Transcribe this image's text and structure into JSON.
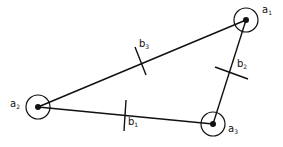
{
  "diagram": {
    "type": "triangle-graph",
    "colors": {
      "stroke": "#111111",
      "background": "#ffffff"
    },
    "nodes": [
      {
        "id": "a1",
        "base": "a",
        "sub": "1",
        "cx": 246,
        "cy": 20,
        "r": 12,
        "label_x": 262,
        "label_y": 5
      },
      {
        "id": "a2",
        "base": "a",
        "sub": "2",
        "cx": 38,
        "cy": 107,
        "r": 12,
        "label_x": 10,
        "label_y": 99
      },
      {
        "id": "a3",
        "base": "a",
        "sub": "3",
        "cx": 213,
        "cy": 124,
        "r": 12,
        "label_x": 228,
        "label_y": 124
      }
    ],
    "edges": [
      {
        "id": "b1",
        "from": "a2",
        "to": "a3",
        "base": "b",
        "sub": "1",
        "tick": [
          126,
          100,
          124,
          131
        ],
        "label_x": 128,
        "label_y": 117
      },
      {
        "id": "b2",
        "from": "a3",
        "to": "a1",
        "base": "b",
        "sub": "2",
        "tick": [
          215,
          67,
          248,
          79
        ],
        "label_x": 237,
        "label_y": 59
      },
      {
        "id": "b3",
        "from": "a1",
        "to": "a2",
        "base": "b",
        "sub": "3",
        "tick": [
          135,
          47,
          146,
          75
        ],
        "label_x": 139,
        "label_y": 39
      }
    ]
  }
}
